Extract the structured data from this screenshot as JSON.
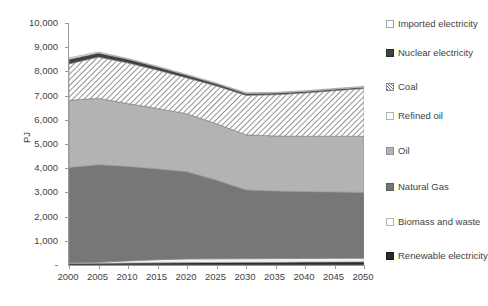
{
  "chart_data": {
    "type": "area",
    "title": "",
    "subtitle": "",
    "xlabel": "",
    "ylabel": "PJ",
    "x": [
      2000,
      2005,
      2010,
      2015,
      2020,
      2025,
      2030,
      2035,
      2040,
      2045,
      2050
    ],
    "xtick_labels": [
      "2000",
      "2005",
      "2010",
      "2015",
      "2020",
      "2025",
      "2030",
      "2035",
      "2040",
      "2045",
      "2050"
    ],
    "xlim": [
      2000,
      2050
    ],
    "ylim": [
      0,
      10000
    ],
    "ytick_labels": [
      "-",
      "1,000",
      "2,000",
      "3,000",
      "4,000",
      "5,000",
      "6,000",
      "7,000",
      "8,000",
      "9,000",
      "10,000"
    ],
    "ytick_values": [
      0,
      1000,
      2000,
      3000,
      4000,
      5000,
      6000,
      7000,
      8000,
      9000,
      10000
    ],
    "grid": false,
    "legend_position": "right",
    "stacked": true,
    "stack_order_bottom_to_top": [
      "Renewable electricity",
      "Biomass and waste",
      "Natural Gas",
      "Oil",
      "Refined oil",
      "Coal",
      "Nuclear electricity",
      "Imported electricity"
    ],
    "series": [
      {
        "name": "Renewable electricity",
        "color": "#2b2b2b",
        "pattern": "solid",
        "values": [
          60,
          70,
          80,
          90,
          100,
          105,
          110,
          115,
          120,
          125,
          130
        ]
      },
      {
        "name": "Biomass and waste",
        "color": "#f2f2f2",
        "pattern": "solid",
        "values": [
          20,
          40,
          90,
          130,
          150,
          150,
          150,
          150,
          150,
          150,
          150
        ]
      },
      {
        "name": "Natural Gas",
        "color": "#777777",
        "pattern": "solid",
        "values": [
          3950,
          4030,
          3900,
          3750,
          3600,
          3250,
          2840,
          2790,
          2760,
          2740,
          2720
        ]
      },
      {
        "name": "Oil",
        "color": "#b3b3b3",
        "pattern": "solid",
        "values": [
          2780,
          2750,
          2600,
          2500,
          2400,
          2330,
          2280,
          2280,
          2290,
          2310,
          2320
        ]
      },
      {
        "name": "Refined oil",
        "color": "#fbfbfb",
        "pattern": "solid",
        "values": [
          0,
          0,
          0,
          0,
          0,
          0,
          0,
          0,
          0,
          0,
          0
        ]
      },
      {
        "name": "Coal",
        "color": "#ffffff",
        "pattern": "diagonal-hatch",
        "values": [
          1500,
          1700,
          1680,
          1580,
          1480,
          1560,
          1630,
          1700,
          1790,
          1880,
          1970
        ]
      },
      {
        "name": "Nuclear electricity",
        "color": "#404040",
        "pattern": "solid",
        "values": [
          190,
          170,
          150,
          130,
          110,
          90,
          80,
          70,
          60,
          60,
          60
        ]
      },
      {
        "name": "Imported electricity",
        "color": "#ffffff",
        "pattern": "solid",
        "values": [
          60,
          40,
          30,
          30,
          30,
          30,
          30,
          30,
          30,
          30,
          30
        ]
      }
    ],
    "totals": [
      8560,
      8800,
      8530,
      8210,
      7870,
      7515,
      7120,
      7135,
      7200,
      7295,
      7380
    ]
  },
  "axes": {
    "y_title": "PJ"
  },
  "legend": {
    "items": [
      {
        "label": "Imported electricity",
        "swatch": "imported"
      },
      {
        "label": "Nuclear electricity",
        "swatch": "nuclear"
      },
      {
        "label": "Coal",
        "swatch": "coal"
      },
      {
        "label": "Refined oil",
        "swatch": "refinedoil"
      },
      {
        "label": "Oil",
        "swatch": "oil"
      },
      {
        "label": "Natural Gas",
        "swatch": "naturalgas"
      },
      {
        "label": "Biomass and waste",
        "swatch": "biomass"
      },
      {
        "label": "Renewable electricity",
        "swatch": "renewable"
      }
    ]
  }
}
